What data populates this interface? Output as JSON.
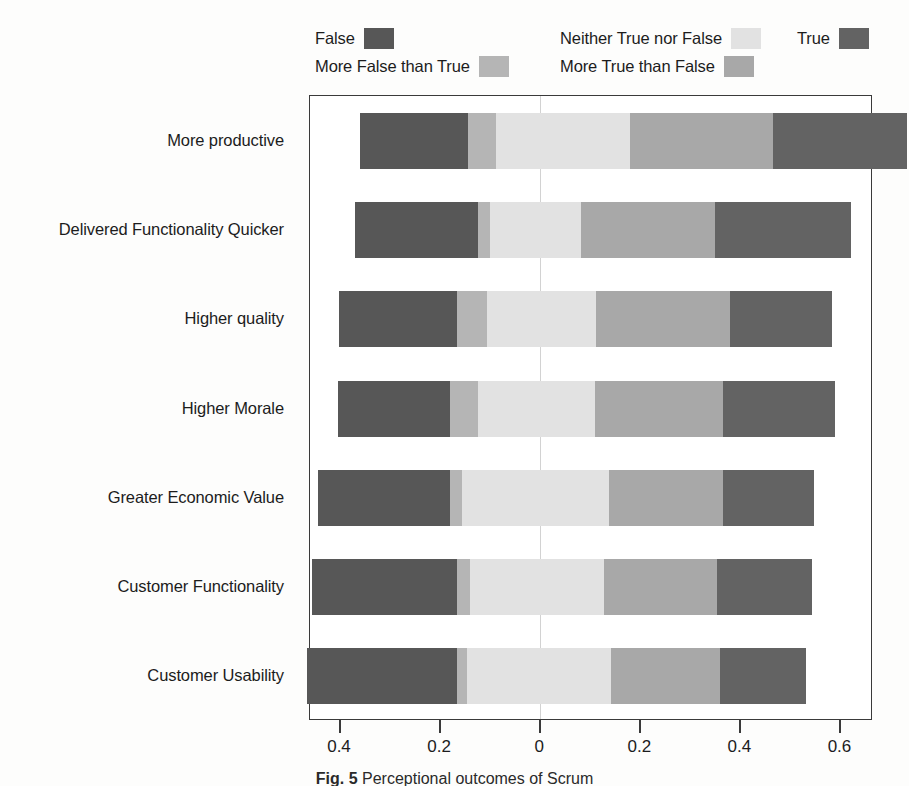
{
  "chart_data": {
    "type": "bar",
    "subtype": "diverging-stacked-likert",
    "title": "",
    "xlabel": "",
    "ylabel": "",
    "orientation": "horizontal",
    "stacked": true,
    "grid": false,
    "zero_reference_line": true,
    "legend_position": "top",
    "xlim": [
      -0.46,
      0.665
    ],
    "xticks": [
      -0.4,
      -0.2,
      0,
      0.2,
      0.4,
      0.6
    ],
    "xticklabels": [
      "0.4",
      "0.2",
      "0",
      "0.2",
      "0.4",
      "0.6"
    ],
    "categories": [
      "More productive",
      "Delivered Functionality Quicker",
      "Higher quality",
      "Higher Morale",
      "Greater Economic Value",
      "Customer Functionality",
      "Customer Usability"
    ],
    "series": [
      {
        "name": "False",
        "color": "#575757",
        "side": "negative",
        "values": [
          0.215,
          0.247,
          0.236,
          0.224,
          0.264,
          0.289,
          0.3
        ]
      },
      {
        "name": "More False than True",
        "color": "#b5b5b5",
        "side": "negative",
        "values": [
          0.056,
          0.024,
          0.06,
          0.056,
          0.024,
          0.027,
          0.02
        ]
      },
      {
        "name": "Neither True nor False",
        "color": "#e2e2e2",
        "side": "center",
        "values": [
          0.269,
          0.182,
          0.218,
          0.233,
          0.293,
          0.267,
          0.289
        ]
      },
      {
        "name": "More True than False",
        "color": "#a8a8a8",
        "side": "positive",
        "values": [
          0.286,
          0.267,
          0.267,
          0.256,
          0.229,
          0.227,
          0.218
        ]
      },
      {
        "name": "True",
        "color": "#636363",
        "side": "positive",
        "values": [
          0.267,
          0.273,
          0.204,
          0.224,
          0.182,
          0.189,
          0.171
        ]
      }
    ],
    "bar_starts": [
      -0.36,
      -0.371,
      -0.402,
      -0.404,
      -0.444,
      -0.456,
      -0.467
    ]
  },
  "legend": {
    "items": [
      {
        "label": "False",
        "color": "#575757",
        "slot": "lc-false"
      },
      {
        "label": "More False than True",
        "color": "#b5b5b5",
        "slot": "lc-morefalse"
      },
      {
        "label": "Neither True nor False",
        "color": "#e2e2e2",
        "slot": "lc-neither"
      },
      {
        "label": "More True than False",
        "color": "#a8a8a8",
        "slot": "lc-moretrue"
      },
      {
        "label": "True",
        "color": "#636363",
        "slot": "lc-true"
      }
    ]
  },
  "caption": {
    "figure_number": "Fig. 5",
    "text": "Perceptional outcomes of Scrum"
  },
  "colors": {
    "frame": "#3a3a3a",
    "zero_line": "#d2d2d2",
    "text": "#1c1c1c",
    "background": "#fdfdfc"
  }
}
